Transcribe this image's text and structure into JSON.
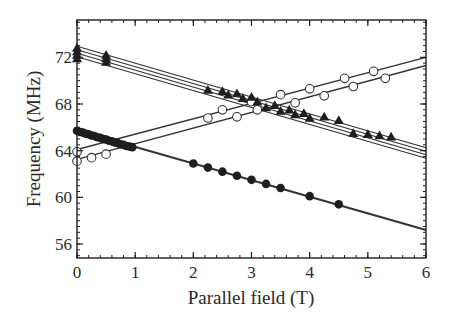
{
  "chart_data": {
    "type": "scatter",
    "title": "",
    "xlabel": "Parallel field (T)",
    "ylabel": "Frequency (MHz)",
    "xlim": [
      0,
      6
    ],
    "ylim": [
      54.8,
      75.2
    ],
    "xticks": [
      0,
      1,
      2,
      3,
      4,
      5,
      6
    ],
    "xtick_labels": [
      "0",
      "1",
      "2",
      "3",
      "4",
      "5",
      "6"
    ],
    "yticks": [
      56,
      60,
      64,
      68,
      72
    ],
    "ytick_labels": [
      "56",
      "60",
      "64",
      "68",
      "72"
    ],
    "x_minor_step": 0.2,
    "y_minor_step": 0.5,
    "grid": false,
    "legend": null,
    "series": [
      {
        "name": "filled circles",
        "marker": "filled-circle",
        "points": [
          [
            0.0,
            65.7
          ],
          [
            0.05,
            65.6
          ],
          [
            0.1,
            65.55
          ],
          [
            0.15,
            65.45
          ],
          [
            0.2,
            65.4
          ],
          [
            0.25,
            65.3
          ],
          [
            0.3,
            65.25
          ],
          [
            0.35,
            65.15
          ],
          [
            0.4,
            65.1
          ],
          [
            0.45,
            65.0
          ],
          [
            0.5,
            64.95
          ],
          [
            0.55,
            64.85
          ],
          [
            0.6,
            64.8
          ],
          [
            0.65,
            64.7
          ],
          [
            0.7,
            64.65
          ],
          [
            0.75,
            64.55
          ],
          [
            0.8,
            64.5
          ],
          [
            0.85,
            64.4
          ],
          [
            0.9,
            64.35
          ],
          [
            0.95,
            64.3
          ],
          [
            2.0,
            62.9
          ],
          [
            2.25,
            62.55
          ],
          [
            2.5,
            62.2
          ],
          [
            2.75,
            61.85
          ],
          [
            3.0,
            61.5
          ],
          [
            3.25,
            61.15
          ],
          [
            3.5,
            60.8
          ],
          [
            4.0,
            60.1
          ],
          [
            4.5,
            59.4
          ]
        ],
        "fit_lines": [
          [
            [
              0,
              65.75
            ],
            [
              6,
              57.2
            ]
          ]
        ]
      },
      {
        "name": "open circles",
        "marker": "open-circle",
        "points": [
          [
            0.0,
            63.9
          ],
          [
            0.0,
            63.1
          ],
          [
            0.25,
            63.4
          ],
          [
            0.5,
            63.7
          ],
          [
            2.25,
            66.8
          ],
          [
            2.5,
            67.5
          ],
          [
            2.75,
            66.9
          ],
          [
            3.0,
            68.2
          ],
          [
            3.1,
            67.5
          ],
          [
            3.5,
            68.8
          ],
          [
            3.75,
            68.1
          ],
          [
            4.0,
            69.3
          ],
          [
            4.25,
            68.7
          ],
          [
            4.6,
            70.2
          ],
          [
            4.75,
            69.5
          ],
          [
            5.1,
            70.8
          ],
          [
            5.3,
            70.2
          ]
        ],
        "fit_lines": [
          [
            [
              0,
              64.1
            ],
            [
              6,
              72.0
            ]
          ],
          [
            [
              0,
              63.25
            ],
            [
              6,
              71.3
            ]
          ]
        ]
      },
      {
        "name": "filled triangles",
        "marker": "filled-triangle",
        "points": [
          [
            0.0,
            72.8
          ],
          [
            0.0,
            72.5
          ],
          [
            0.0,
            72.2
          ],
          [
            0.0,
            71.9
          ],
          [
            0.5,
            72.2
          ],
          [
            0.5,
            71.9
          ],
          [
            0.5,
            71.6
          ],
          [
            2.25,
            69.2
          ],
          [
            2.5,
            69.1
          ],
          [
            2.6,
            68.8
          ],
          [
            2.75,
            68.9
          ],
          [
            2.85,
            68.5
          ],
          [
            3.0,
            68.6
          ],
          [
            3.1,
            68.2
          ],
          [
            3.25,
            67.7
          ],
          [
            3.4,
            67.9
          ],
          [
            3.5,
            67.4
          ],
          [
            3.65,
            67.5
          ],
          [
            3.75,
            67.1
          ],
          [
            3.9,
            67.2
          ],
          [
            4.0,
            66.8
          ],
          [
            4.25,
            66.9
          ],
          [
            4.5,
            66.6
          ],
          [
            4.75,
            65.5
          ],
          [
            5.0,
            65.4
          ],
          [
            5.2,
            65.3
          ],
          [
            5.4,
            65.2
          ]
        ],
        "fit_lines": [
          [
            [
              0,
              72.95
            ],
            [
              6,
              64.25
            ]
          ],
          [
            [
              0,
              72.65
            ],
            [
              6,
              63.95
            ]
          ],
          [
            [
              0,
              72.35
            ],
            [
              6,
              63.65
            ]
          ],
          [
            [
              0,
              72.05
            ],
            [
              6,
              63.35
            ]
          ]
        ]
      }
    ]
  },
  "plot_box": {
    "left": 77,
    "top": 20,
    "right": 426,
    "bottom": 258
  },
  "colors": {
    "ink": "#1e1e1e",
    "line": "#333333",
    "background": "#ffffff"
  },
  "labels": {
    "xlabel": "Parallel field (T)",
    "ylabel": "Frequency (MHz)"
  }
}
